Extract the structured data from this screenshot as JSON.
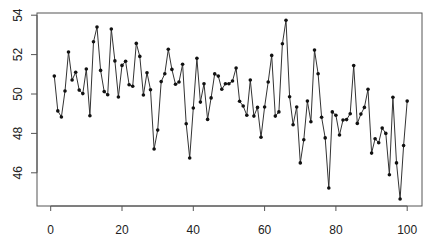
{
  "chart_data": {
    "type": "line",
    "title": "",
    "xlabel": "",
    "ylabel": "",
    "xlim": [
      -4,
      104
    ],
    "ylim": [
      44.3,
      54.2
    ],
    "grid": false,
    "legend": null,
    "marker": "filled-circle",
    "line_color": "#333333",
    "x_ticks": [
      0,
      20,
      40,
      60,
      80,
      100
    ],
    "x_tick_labels": [
      "0",
      "20",
      "40",
      "60",
      "80",
      "100"
    ],
    "y_ticks": [
      46,
      48,
      50,
      52,
      54
    ],
    "y_tick_labels": [
      "46",
      "48",
      "50",
      "52",
      "54"
    ],
    "x": [
      1,
      2,
      3,
      4,
      5,
      6,
      7,
      8,
      9,
      10,
      11,
      12,
      13,
      14,
      15,
      16,
      17,
      18,
      19,
      20,
      21,
      22,
      23,
      24,
      25,
      26,
      27,
      28,
      29,
      30,
      31,
      32,
      33,
      34,
      35,
      36,
      37,
      38,
      39,
      40,
      41,
      42,
      43,
      44,
      45,
      46,
      47,
      48,
      49,
      50,
      51,
      52,
      53,
      54,
      55,
      56,
      57,
      58,
      59,
      60,
      61,
      62,
      63,
      64,
      65,
      66,
      67,
      68,
      69,
      70,
      71,
      72,
      73,
      74,
      75,
      76,
      77,
      78,
      79,
      80,
      81,
      82,
      83,
      84,
      85,
      86,
      87,
      88,
      89,
      90,
      91,
      92,
      93,
      94,
      95,
      96,
      97,
      98,
      99,
      100
    ],
    "series": [
      {
        "name": "series",
        "values": [
          50.91,
          49.14,
          48.83,
          50.15,
          52.13,
          50.71,
          51.1,
          50.2,
          50.02,
          51.27,
          48.9,
          52.65,
          53.4,
          51.2,
          50.12,
          49.96,
          53.3,
          51.68,
          49.85,
          51.45,
          51.66,
          50.47,
          50.39,
          52.57,
          51.91,
          49.95,
          51.08,
          50.22,
          47.21,
          48.17,
          50.63,
          51.03,
          52.27,
          51.25,
          50.49,
          50.61,
          51.51,
          48.49,
          46.75,
          49.29,
          51.81,
          49.59,
          50.52,
          48.71,
          49.8,
          51.02,
          50.91,
          50.24,
          50.52,
          50.52,
          50.66,
          51.32,
          49.63,
          49.39,
          48.92,
          50.71,
          48.88,
          49.32,
          47.8,
          49.34,
          50.61,
          51.96,
          48.88,
          49.09,
          52.55,
          53.74,
          49.86,
          48.44,
          49.34,
          46.5,
          47.68,
          49.64,
          48.59,
          52.23,
          51.03,
          48.82,
          47.77,
          45.23,
          49.09,
          48.92,
          47.92,
          48.68,
          48.7,
          49.0,
          51.44,
          48.51,
          48.98,
          49.32,
          50.24,
          47.0,
          47.73,
          47.53,
          48.27,
          48.0,
          45.9,
          49.83,
          46.5,
          44.67,
          47.38,
          49.64
        ]
      }
    ]
  }
}
